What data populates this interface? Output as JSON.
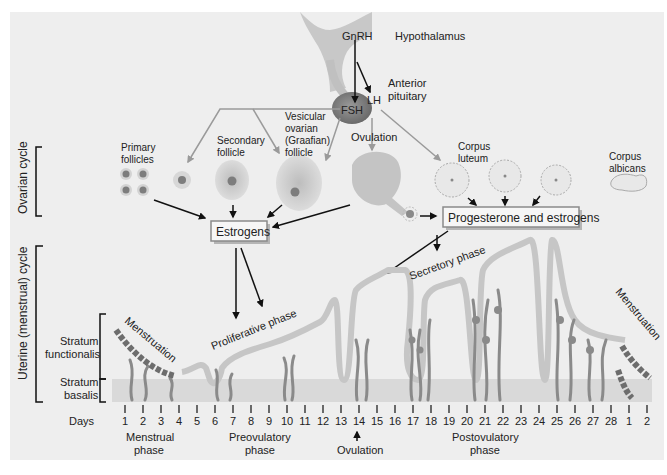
{
  "colors": {
    "background": "#eeeeee",
    "tissue_light": "#c9c9c9",
    "tissue_dark": "#7a7a7a",
    "menstruation": "#6d6d6d",
    "basalis_band": "#d9d9d9",
    "box_border": "#8a8a8a",
    "arrow": "#111111",
    "hormone_arrow": "#9a9a9a"
  },
  "hypothalamus": {
    "hormone": "GnRH",
    "label": "Hypothalamus"
  },
  "pituitary": {
    "label_line1": "Anterior",
    "label_line2": "pituitary",
    "hormone_fsh": "FSH",
    "hormone_lh": "LH"
  },
  "side_labels": {
    "ovarian_cycle": "Ovarian cycle",
    "uterine_cycle": "Uterine (menstrual) cycle",
    "stratum_functionalis_1": "Stratum",
    "stratum_functionalis_2": "functionalis",
    "stratum_basalis_1": "Stratum",
    "stratum_basalis_2": "basalis"
  },
  "ovarian_stages": [
    {
      "line1": "Primary",
      "line2": "follicles"
    },
    {
      "line1": "Secondary",
      "line2": "follicle"
    },
    {
      "line1": "Vesicular",
      "line2": "ovarian",
      "line3": "(Graafian)",
      "line4": "follicle"
    },
    {
      "line1": "Ovulation"
    },
    {
      "line1": "Corpus",
      "line2": "luteum"
    },
    {
      "line1": "Corpus",
      "line2": "albicans"
    }
  ],
  "hormone_boxes": {
    "estrogens": "Estrogens",
    "progesterone": "Progesterone and estrogens"
  },
  "uterine_phases": {
    "menstruation_start": "Menstruation",
    "proliferative": "Proliferative phase",
    "secretory": "Secretory phase",
    "menstruation_end": "Menstruation"
  },
  "timeline": {
    "label": "Days",
    "days": [
      "1",
      "2",
      "3",
      "4",
      "5",
      "6",
      "7",
      "8",
      "9",
      "10",
      "11",
      "12",
      "13",
      "14",
      "15",
      "16",
      "17",
      "18",
      "19",
      "20",
      "21",
      "22",
      "23",
      "24",
      "25",
      "26",
      "27",
      "28",
      "1",
      "2"
    ],
    "phases": [
      {
        "line1": "Menstrual",
        "line2": "phase"
      },
      {
        "line1": "Preovulatory",
        "line2": "phase"
      },
      {
        "line1": "Ovulation"
      },
      {
        "line1": "Postovulatory",
        "line2": "phase"
      }
    ]
  }
}
